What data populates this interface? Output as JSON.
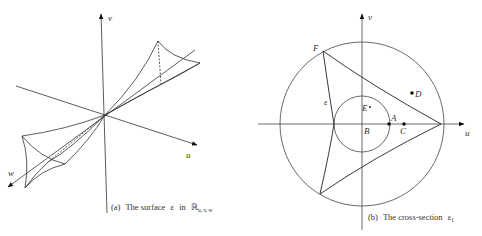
{
  "figure": {
    "panel_a": {
      "caption_prefix": "(a)",
      "caption_text": "The surface",
      "surface_symbol": "ε",
      "caption_in": "in",
      "space_symbol": "ℝ",
      "space_subscript": "u, v, w",
      "axis_labels": {
        "u": "u",
        "v": "v",
        "w": "w"
      }
    },
    "panel_b": {
      "caption_prefix": "(b)",
      "caption_text": "The cross-section",
      "section_symbol": "ε",
      "section_subscript": "1",
      "axis_labels": {
        "u": "u",
        "v": "v"
      },
      "curve_label": "ε",
      "points": [
        {
          "name": "A",
          "filled": true
        },
        {
          "name": "B",
          "filled": false
        },
        {
          "name": "C",
          "filled": true
        },
        {
          "name": "D",
          "filled": true
        },
        {
          "name": "E",
          "filled": true
        },
        {
          "name": "F",
          "filled": false
        }
      ]
    }
  }
}
